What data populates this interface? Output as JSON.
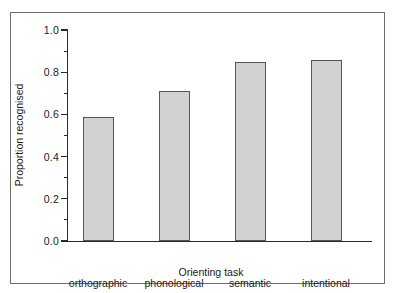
{
  "chart_data": {
    "type": "bar",
    "title": "",
    "subtitle": "",
    "xlabel": "Orienting task",
    "ylabel": "Proportion recognised",
    "categories": [
      "orthographic",
      "phonological",
      "semantic",
      "intentional"
    ],
    "values": [
      0.59,
      0.71,
      0.85,
      0.86
    ],
    "series": [
      {
        "name": "Proportion recognised",
        "values": [
          0.59,
          0.71,
          0.85,
          0.86
        ]
      }
    ],
    "ylim": [
      0.0,
      1.0
    ],
    "ytick_labels": [
      "0.0",
      "0.2",
      "0.4",
      "0.6",
      "0.8",
      "1.0"
    ],
    "ytick_values": [
      0.0,
      0.2,
      0.4,
      0.6,
      0.8,
      1.0
    ],
    "yminor_tick_values": [
      0.1,
      0.3,
      0.5,
      0.7,
      0.9
    ],
    "grid": false,
    "legend": false,
    "legend_position": "none",
    "bar_fill_color": "#d2d2d2",
    "bar_edge_color": "#555555",
    "axis_color": "#2a2a2a",
    "frame_color": "#6e6e6e",
    "background_color": "#ffffff"
  }
}
